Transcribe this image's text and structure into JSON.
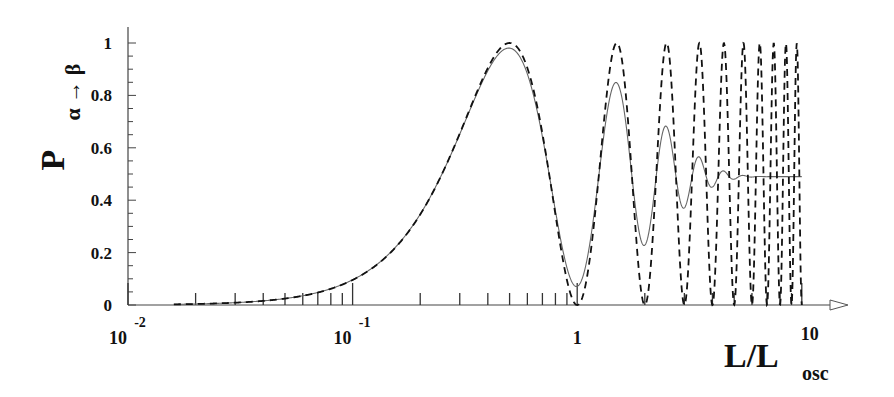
{
  "chart_data": {
    "type": "line",
    "title": "",
    "xlabel": "L/L_osc",
    "xlabel_main": "L/L",
    "xlabel_sub": "osc",
    "ylabel": "P_{α→β}",
    "ylabel_main": "P",
    "ylabel_sub": "α → β",
    "xscale": "log",
    "xlim": [
      0.01,
      10
    ],
    "ylim": [
      0,
      1
    ],
    "x_ticks": [
      {
        "value": 0.01,
        "base": "10",
        "exp": "-2"
      },
      {
        "value": 0.1,
        "base": "10",
        "exp": "-1"
      },
      {
        "value": 1,
        "base": "1",
        "exp": ""
      },
      {
        "value": 10,
        "base": "10",
        "exp": ""
      }
    ],
    "y_ticks": [
      "0",
      "0.2",
      "0.4",
      "0.6",
      "0.8",
      "1"
    ],
    "grid": false,
    "legend": "none",
    "series": [
      {
        "name": "oscillation (no averaging)",
        "style": "dashed",
        "formula": "sin^2(pi * L/L_osc)",
        "x": [
          0.016,
          0.05,
          0.1,
          0.2,
          0.3,
          0.5,
          0.7,
          1.0,
          1.5,
          2.0,
          2.5,
          3.0,
          3.5,
          4.0,
          5.0,
          6.0,
          7.0,
          8.0,
          9.0,
          10.0
        ],
        "y": [
          0.0,
          0.02,
          0.1,
          0.35,
          0.65,
          1.0,
          0.65,
          0.0,
          1.0,
          0.0,
          1.0,
          0.0,
          1.0,
          0.0,
          0.0,
          0.0,
          0.0,
          0.0,
          0.0,
          0.0
        ]
      },
      {
        "name": "averaged (damped)",
        "style": "solid",
        "x": [
          0.016,
          0.05,
          0.1,
          0.2,
          0.3,
          0.5,
          0.7,
          1.0,
          1.5,
          2.0,
          2.5,
          3.0,
          3.5,
          4.0,
          5.0,
          7.0,
          10.0
        ],
        "y": [
          0.0,
          0.02,
          0.1,
          0.35,
          0.64,
          0.97,
          0.64,
          0.09,
          0.81,
          0.27,
          0.65,
          0.41,
          0.55,
          0.47,
          0.5,
          0.49,
          0.49
        ]
      }
    ]
  }
}
